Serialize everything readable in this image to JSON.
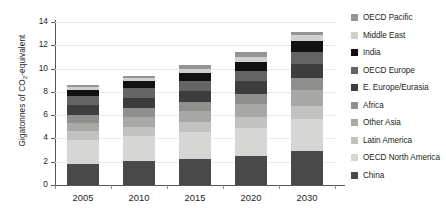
{
  "chart_data": {
    "type": "bar",
    "stacked": true,
    "title": "",
    "xlabel": "",
    "ylabel": "Gigatonnes of CO2-equivalent",
    "ylabel_prefix": "Gigatonnes of CO",
    "ylabel_sub": "2",
    "ylabel_suffix": "-equivalent",
    "categories": [
      "2005",
      "2010",
      "2015",
      "2020",
      "2030"
    ],
    "ylim": [
      0,
      14
    ],
    "yticks": [
      0,
      2,
      4,
      6,
      8,
      10,
      12,
      14
    ],
    "ytick_labels": [
      "0",
      "2",
      "4",
      "6",
      "8",
      "10",
      "12",
      "14"
    ],
    "grid": true,
    "legend_position": "right",
    "legend_order": "reversed",
    "totals": [
      8.6,
      9.4,
      10.3,
      11.4,
      13.1
    ],
    "series": [
      {
        "name": "China",
        "color": "#494949",
        "values": [
          1.8,
          2.05,
          2.25,
          2.45,
          2.95
        ]
      },
      {
        "name": "OECD North America",
        "color": "#d6d6d4",
        "values": [
          2.05,
          2.15,
          2.3,
          2.45,
          2.75
        ]
      },
      {
        "name": "Latin America",
        "color": "#c2c2c0",
        "values": [
          0.75,
          0.8,
          0.85,
          0.95,
          1.1
        ]
      },
      {
        "name": "Other Asia",
        "color": "#a8a8a6",
        "values": [
          0.75,
          0.85,
          0.95,
          1.1,
          1.35
        ]
      },
      {
        "name": "Africa",
        "color": "#8f8f8d",
        "values": [
          0.7,
          0.75,
          0.8,
          0.9,
          1.05
        ]
      },
      {
        "name": "E. Europe/Eurasia",
        "color": "#3d3d3d",
        "values": [
          0.85,
          0.9,
          0.95,
          1.05,
          1.2
        ]
      },
      {
        "name": "OECD Europe",
        "color": "#646464",
        "values": [
          0.75,
          0.8,
          0.85,
          0.9,
          1.0
        ]
      },
      {
        "name": "India",
        "color": "#111111",
        "values": [
          0.55,
          0.6,
          0.7,
          0.8,
          1.0
        ]
      },
      {
        "name": "Middle East",
        "color": "#d0d0ce",
        "values": [
          0.25,
          0.28,
          0.32,
          0.38,
          0.45
        ]
      },
      {
        "name": "OECD Pacific",
        "color": "#949494",
        "values": [
          0.15,
          0.22,
          0.33,
          0.42,
          0.25
        ]
      }
    ],
    "legend_entries": [
      {
        "label": "OECD Pacific",
        "color": "#949494"
      },
      {
        "label": "Middle East",
        "color": "#d0d0ce"
      },
      {
        "label": "India",
        "color": "#111111"
      },
      {
        "label": "OECD Europe",
        "color": "#646464"
      },
      {
        "label": "E. Europe/Eurasia",
        "color": "#3d3d3d"
      },
      {
        "label": "Africa",
        "color": "#8f8f8d"
      },
      {
        "label": "Other Asia",
        "color": "#a8a8a6"
      },
      {
        "label": "Latin America",
        "color": "#c2c2c0"
      },
      {
        "label": "OECD North America",
        "color": "#d6d6d4"
      },
      {
        "label": "China",
        "color": "#494949"
      }
    ],
    "axis_color": "#58585b",
    "grid_color": "#e9e9e7"
  }
}
